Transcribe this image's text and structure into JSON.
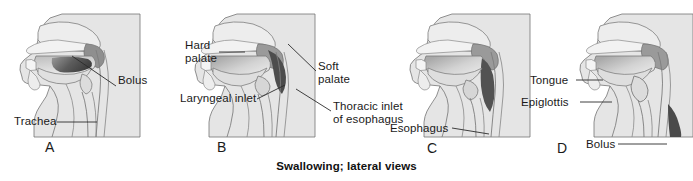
{
  "figure": {
    "caption": "Swallowing; lateral views",
    "colors": {
      "background": "#ffffff",
      "tissue_fill": "#e3e3e3",
      "tissue_fill_light": "#eeeeee",
      "outline": "#6b6b6b",
      "bolus_dark": "#4a4a4a",
      "bolus_mid": "#8c8c8c",
      "label_text": "#1a1a1a",
      "leader_line": "#2b2b2b"
    },
    "panels": [
      {
        "id": "A",
        "letter": "A",
        "letter_pos": {
          "x": 50,
          "y": 140
        },
        "view_box": {
          "x": 10,
          "y": 12,
          "w": 160,
          "h": 125
        },
        "labels": [
          {
            "name": "bolus",
            "text": "Bolus",
            "text_pos": {
              "x": 118,
              "y": 81
            },
            "leader": {
              "x1": 116,
              "y1": 86,
              "x2": 72,
              "y2": 56
            }
          },
          {
            "name": "trachea",
            "text": "Trachea",
            "text_pos": {
              "x": 14,
              "y": 117
            },
            "leader": {
              "x1": 57,
              "y1": 122,
              "x2": 95,
              "y2": 122
            }
          }
        ]
      },
      {
        "id": "B",
        "letter": "B",
        "letter_pos": {
          "x": 222,
          "y": 140
        },
        "view_box": {
          "x": 185,
          "y": 12,
          "w": 160,
          "h": 125
        },
        "labels": [
          {
            "name": "hard-palate",
            "text": "Hard\npalate",
            "text_pos": {
              "x": 185,
              "y": 45
            },
            "leader": {
              "x1": 219,
              "y1": 52,
              "x2": 243,
              "y2": 52
            }
          },
          {
            "name": "soft-palate",
            "text": "Soft\npalate",
            "text_pos": {
              "x": 318,
              "y": 66
            },
            "leader": {
              "x1": 316,
              "y1": 71,
              "x2": 290,
              "y2": 44
            }
          },
          {
            "name": "laryngeal-inlet",
            "text": "Laryngeal inlet",
            "text_pos": {
              "x": 182,
              "y": 94
            },
            "leader": {
              "x1": 257,
              "y1": 99,
              "x2": 285,
              "y2": 85
            }
          },
          {
            "name": "thoracic-inlet-of-esophagus",
            "text": "Thoracic inlet\nof esophagus",
            "text_pos": {
              "x": 333,
              "y": 106
            },
            "leader": {
              "x1": 331,
              "y1": 111,
              "x2": 296,
              "y2": 89
            }
          }
        ]
      },
      {
        "id": "C",
        "letter": "C",
        "letter_pos": {
          "x": 432,
          "y": 142
        },
        "view_box": {
          "x": 400,
          "y": 12,
          "w": 160,
          "h": 125
        },
        "labels": [
          {
            "name": "esophagus",
            "text": "Esophagus",
            "text_pos": {
              "x": 392,
              "y": 124
            },
            "leader": {
              "x1": 452,
              "y1": 129,
              "x2": 487,
              "y2": 136
            }
          }
        ]
      },
      {
        "id": "D",
        "letter": "D",
        "letter_pos": {
          "x": 562,
          "y": 142
        },
        "view_box": {
          "x": 555,
          "y": 12,
          "w": 140,
          "h": 125
        },
        "labels": [
          {
            "name": "tongue",
            "text": "Tongue",
            "text_pos": {
              "x": 532,
              "y": 75
            },
            "leader": {
              "x1": 576,
              "y1": 80,
              "x2": 601,
              "y2": 80
            }
          },
          {
            "name": "epiglottis",
            "text": "Epiglottis",
            "text_pos": {
              "x": 524,
              "y": 97
            },
            "leader": {
              "x1": 580,
              "y1": 102,
              "x2": 610,
              "y2": 102
            }
          },
          {
            "name": "bolus",
            "text": "Bolus",
            "text_pos": {
              "x": 587,
              "y": 140
            },
            "leader": {
              "x1": 618,
              "y1": 144,
              "x2": 665,
              "y2": 144
            }
          }
        ]
      }
    ]
  }
}
